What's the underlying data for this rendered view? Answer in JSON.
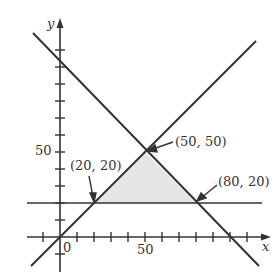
{
  "diagram": {
    "type": "linear-programming-feasible-region",
    "axes": {
      "x_label": "x",
      "y_label": "y",
      "origin_label": "0"
    },
    "tick_labels": {
      "x": "50",
      "y": "50"
    },
    "tick_step": 10,
    "lines": [
      {
        "name": "y = x",
        "from": [
          -17,
          -17
        ],
        "to": [
          115,
          115
        ]
      },
      {
        "name": "x + y = 100",
        "from": [
          -16,
          116
        ],
        "to": [
          117,
          -17
        ]
      },
      {
        "name": "y = 20",
        "from": [
          -19,
          20
        ],
        "to": [
          119,
          20
        ]
      }
    ],
    "vertices": [
      {
        "label": "(20, 20)",
        "x": 20,
        "y": 20
      },
      {
        "label": "(50, 50)",
        "x": 50,
        "y": 50
      },
      {
        "label": "(80, 20)",
        "x": 80,
        "y": 20
      }
    ],
    "shaded_region_fill": "#e8e8e8",
    "line_color": "#333333"
  }
}
